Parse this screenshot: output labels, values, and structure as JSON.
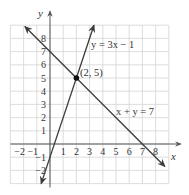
{
  "chart_data": {
    "type": "line",
    "title": "",
    "xlabel": "x",
    "ylabel": "y",
    "xlim": [
      -3,
      9
    ],
    "ylim": [
      -3,
      9
    ],
    "grid": true,
    "x_tick_labels": [
      "−2",
      "−1",
      "1",
      "2",
      "3",
      "4",
      "5",
      "6",
      "7",
      "8"
    ],
    "x_ticks": [
      -2,
      -1,
      1,
      2,
      3,
      4,
      5,
      6,
      7,
      8
    ],
    "y_tick_labels": [
      "8",
      "7",
      "6",
      "5",
      "4",
      "3",
      "2",
      "1",
      "−1",
      "−2"
    ],
    "y_ticks": [
      8,
      7,
      6,
      5,
      4,
      3,
      2,
      1,
      -1,
      -2
    ],
    "series": [
      {
        "name": "y = 3x − 1",
        "equation": "y = 3x - 1",
        "from": [
          -0.67,
          -3
        ],
        "to": [
          3.33,
          9
        ],
        "color": "#3a3a3a"
      },
      {
        "name": "x + y = 7",
        "equation": "x + y = 7",
        "from": [
          -1.9,
          8.9
        ],
        "to": [
          8.7,
          -1.7
        ],
        "color": "#3a3a3a"
      }
    ],
    "points": [
      {
        "x": 2,
        "y": 5,
        "label": "(2, 5)"
      }
    ],
    "annotations": [
      {
        "text": "y = 3x − 1",
        "near": [
          3.1,
          7.5
        ]
      },
      {
        "text": "x + y = 7",
        "near": [
          5,
          2.5
        ]
      }
    ]
  },
  "labels": {
    "x_axis": "x",
    "y_axis": "y",
    "line1": "y = 3x − 1",
    "line2": "x + y = 7",
    "intersection": "(2, 5)"
  }
}
